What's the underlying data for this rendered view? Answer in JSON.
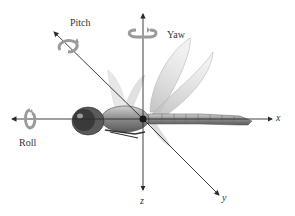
{
  "diagram": {
    "rotation_labels": {
      "pitch": "Pitch",
      "yaw": "Yaw",
      "roll": "Roll"
    },
    "axis_labels": {
      "x": "x",
      "y": "y",
      "z": "z"
    },
    "icons": [
      "rotation-arrow-pitch",
      "rotation-arrow-yaw",
      "rotation-arrow-roll"
    ],
    "colors": {
      "axis": "#2a2a2a",
      "rotation_arrow": "#9a9a9a",
      "body_dark": "#3a3a3a",
      "wing": "#c8c8c8"
    }
  }
}
